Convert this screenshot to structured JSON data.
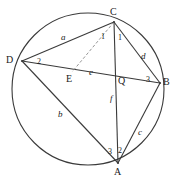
{
  "figure": {
    "kind": "cyclic-quadrilateral-with-cevian",
    "stroke_color": "#3a3a3a",
    "dashed_color": "#8a8a8a",
    "background": "#ffffff",
    "circle": {
      "cx": 88,
      "cy": 89,
      "r": 76
    },
    "vertices": [
      {
        "id": "C",
        "label": "C",
        "x": 114,
        "y": 22,
        "label_x": 110,
        "label_y": 7
      },
      {
        "id": "D",
        "label": "D",
        "x": 22,
        "y": 61,
        "label_x": 6,
        "label_y": 55
      },
      {
        "id": "B",
        "label": "B",
        "x": 160,
        "y": 83,
        "label_x": 163,
        "label_y": 77
      },
      {
        "id": "A",
        "label": "A",
        "x": 118,
        "y": 163,
        "label_x": 114,
        "label_y": 167
      },
      {
        "id": "E",
        "label": "E",
        "x": 72,
        "y": 72,
        "label_x": 66,
        "label_y": 74
      },
      {
        "id": "Q",
        "label": "Q",
        "x": 116,
        "y": 79,
        "label_x": 118,
        "label_y": 76
      }
    ],
    "edges": [
      {
        "name": "edge-D-C",
        "from": "D",
        "to": "C",
        "style": "solid"
      },
      {
        "name": "edge-C-B",
        "from": "C",
        "to": "B",
        "style": "solid"
      },
      {
        "name": "edge-B-A",
        "from": "B",
        "to": "A",
        "style": "solid"
      },
      {
        "name": "edge-A-D",
        "from": "A",
        "to": "D",
        "style": "solid"
      },
      {
        "name": "diagonal-D-B",
        "from": "D",
        "to": "B",
        "style": "solid"
      },
      {
        "name": "diagonal-C-A",
        "from": "C",
        "to": "A",
        "style": "solid"
      },
      {
        "name": "cevian-C-E",
        "from": "C",
        "to": "E",
        "style": "dashed"
      }
    ],
    "side_labels": [
      {
        "name": "side-label-a",
        "text": "a",
        "x": 61,
        "y": 33
      },
      {
        "name": "side-label-b",
        "text": "b",
        "x": 58,
        "y": 110
      },
      {
        "name": "side-label-c",
        "text": "c",
        "x": 138,
        "y": 128
      },
      {
        "name": "side-label-d",
        "text": "d",
        "x": 141,
        "y": 52
      }
    ],
    "segment_labels": [
      {
        "name": "segment-label-e",
        "text": "e",
        "x": 89,
        "y": 68
      },
      {
        "name": "segment-label-f",
        "text": "f",
        "x": 110,
        "y": 94
      }
    ],
    "angle_labels": [
      {
        "name": "angle-label-C1-left",
        "text": "1",
        "x": 101,
        "y": 33
      },
      {
        "name": "angle-label-C1-right",
        "text": "1",
        "x": 118,
        "y": 34
      },
      {
        "name": "angle-label-D2",
        "text": "2",
        "x": 37,
        "y": 58
      },
      {
        "name": "angle-label-B3",
        "text": "3",
        "x": 146,
        "y": 76
      },
      {
        "name": "angle-label-A3",
        "text": "3",
        "x": 108,
        "y": 148
      },
      {
        "name": "angle-label-A2",
        "text": "2",
        "x": 118,
        "y": 147
      }
    ]
  }
}
